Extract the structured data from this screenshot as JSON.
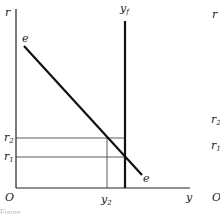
{
  "diagram": {
    "left_panel": {
      "axes": {
        "vertical_label": "r",
        "horizontal_label": "y",
        "origin_label": "O"
      },
      "curves": [
        {
          "name": "e",
          "label_start": "e",
          "label_end": "e",
          "type": "downward-sloping line"
        }
      ],
      "vertical_lines": [
        {
          "name": "y_f",
          "label_base": "y",
          "label_sub": "f",
          "style": "bold"
        },
        {
          "name": "y_2",
          "label_base": "y",
          "label_sub": "2",
          "style": "thin"
        }
      ],
      "horizontal_lines": [
        {
          "name": "r_2",
          "label_base": "r",
          "label_sub": "2"
        },
        {
          "name": "r_1",
          "label_base": "r",
          "label_sub": "1"
        }
      ]
    },
    "right_panel_partial": {
      "vertical_label": "r",
      "r2_label_base": "r",
      "r2_label_sub": "2",
      "r1_label_base": "r",
      "r1_label_sub": "1",
      "origin_label": "O"
    },
    "caption_fragment": "Figure"
  }
}
